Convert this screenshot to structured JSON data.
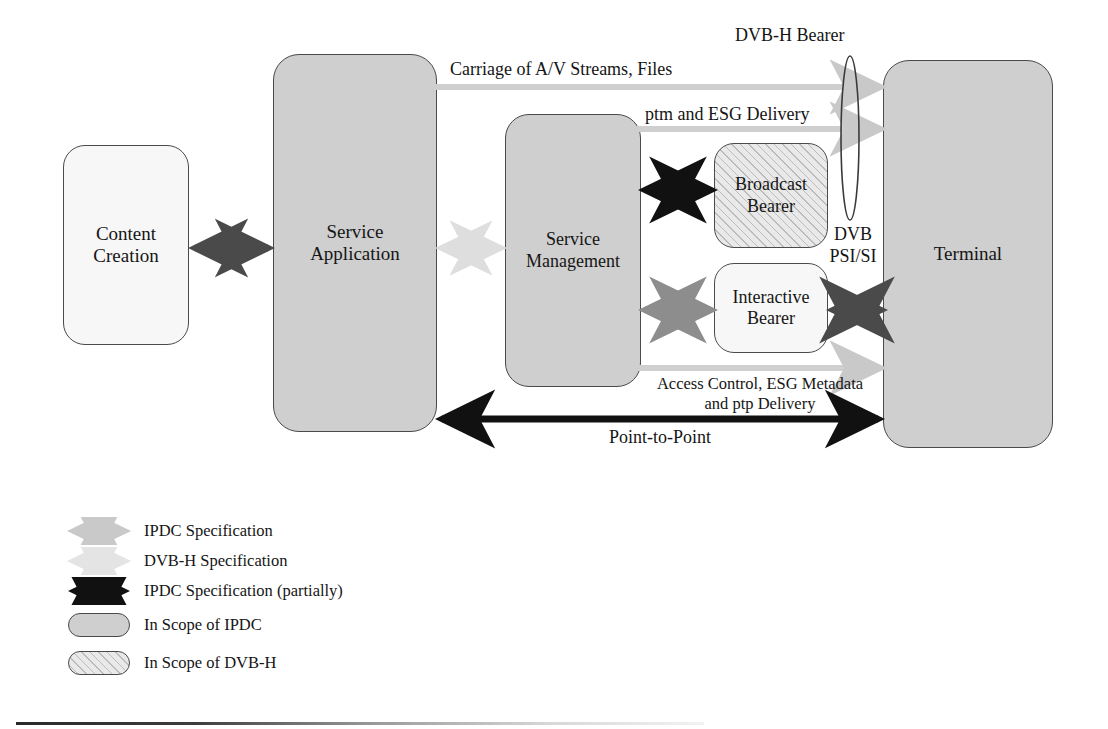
{
  "diagram": {
    "nodes": [
      {
        "id": "content_creation",
        "label_line1": "Content",
        "label_line2": "Creation",
        "scope": "none",
        "fill": "#f7f7f7"
      },
      {
        "id": "service_application",
        "label_line1": "Service",
        "label_line2": "Application",
        "scope": "ipdc",
        "fill": "#cfcfcf"
      },
      {
        "id": "service_management",
        "label_line1": "Service",
        "label_line2": "Management",
        "scope": "ipdc",
        "fill": "#cfcfcf"
      },
      {
        "id": "broadcast_bearer",
        "label_line1": "Broadcast",
        "label_line2": "Bearer",
        "scope": "dvbh",
        "fill": "#e9e9e9"
      },
      {
        "id": "interactive_bearer",
        "label_line1": "Interactive",
        "label_line2": "Bearer",
        "scope": "none",
        "fill": "#f7f7f7"
      },
      {
        "id": "terminal",
        "label_line1": "Terminal",
        "label_line2": "",
        "scope": "ipdc",
        "fill": "#cfcfcf"
      }
    ],
    "annotations": {
      "dvbh_bearer": "DVB-H Bearer",
      "carriage": "Carriage of A/V Streams, Files",
      "ptm_esg": "ptm and ESG Delivery",
      "dvb_psi_line1": "DVB",
      "dvb_psi_line2": "PSI/SI",
      "access_control_line1": "Access Control, ESG Metadata",
      "access_control_line2": "and ptp Delivery",
      "point_to_point": "Point-to-Point"
    }
  },
  "legend": {
    "items": [
      {
        "symbol": "arrow-light-gray",
        "label": "IPDC Specification"
      },
      {
        "symbol": "arrow-pale-gray",
        "label": "DVB-H Specification"
      },
      {
        "symbol": "arrow-black",
        "label": "IPDC Specification (partially)"
      },
      {
        "symbol": "pill-gray-filled",
        "label": "In Scope of IPDC"
      },
      {
        "symbol": "pill-hatched",
        "label": "In Scope of DVB-H"
      }
    ]
  },
  "colors": {
    "ipdc_fill": "#cfcfcf",
    "plain_fill": "#f7f7f7",
    "dvbh_hatch_fill": "#e9e9e9",
    "border": "#4a4a4a",
    "arrow_black": "#111111",
    "arrow_dark_gray": "#4a4a4a",
    "arrow_mid_gray": "#8d8d8d",
    "arrow_light_gray": "#c9c9c9",
    "arrow_pale_gray": "#e2e2e2",
    "text": "#151515"
  }
}
